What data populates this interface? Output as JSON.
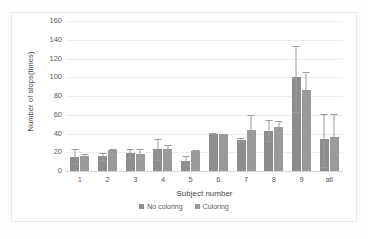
{
  "chart_data": {
    "type": "bar",
    "title": "",
    "xlabel": "Subject number",
    "ylabel": "Number of stops(times)",
    "ylim": [
      0,
      160
    ],
    "ytick_step": 20,
    "yticks": [
      160,
      140,
      120,
      100,
      80,
      60,
      40,
      20,
      0
    ],
    "grid": true,
    "legend_position": "bottom",
    "categories": [
      "1",
      "2",
      "3",
      "4",
      "5",
      "6",
      "7",
      "8",
      "9",
      "all"
    ],
    "series": [
      {
        "name": "No coloring",
        "color": "#8d8d8d",
        "values": [
          15,
          16,
          19,
          23,
          11,
          40,
          33,
          43,
          100,
          34
        ],
        "err_low": [
          8,
          4,
          5,
          11,
          5,
          1,
          2,
          11,
          37,
          30
        ],
        "err_high": [
          8,
          3,
          5,
          11,
          5,
          1,
          2,
          11,
          33,
          27
        ]
      },
      {
        "name": "Culoring",
        "color": "#9a9a9a",
        "values": [
          16,
          22,
          18,
          23,
          21,
          39,
          44,
          47,
          86,
          36
        ],
        "err_low": [
          2,
          1,
          5,
          5,
          1,
          1,
          16,
          7,
          29,
          30
        ],
        "err_high": [
          2,
          1,
          5,
          5,
          1,
          1,
          16,
          6,
          20,
          25
        ]
      }
    ]
  },
  "legend": {
    "items": [
      {
        "label": "No coloring"
      },
      {
        "label": "Culoring"
      }
    ]
  }
}
